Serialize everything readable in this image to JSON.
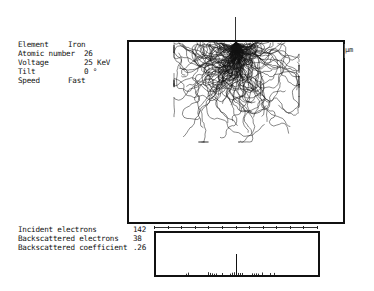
{
  "parameters": [
    {
      "label": "Element",
      "value": "Iron"
    },
    {
      "label": "Atomic number",
      "value": "26"
    },
    {
      "label": "Voltage",
      "value": "25 KeV"
    },
    {
      "label": "Tilt",
      "value": "0 °"
    },
    {
      "label": "Speed",
      "value": "Fast"
    }
  ],
  "results": [
    {
      "label": "Incident electrons",
      "value": "142"
    },
    {
      "label": "Backscattered electrons",
      "value": "38"
    },
    {
      "label": "Backscattered coefficient",
      "value": ".26"
    }
  ],
  "plot": {
    "unit_label": "µm",
    "ruler_ticks": 13
  },
  "colors": {
    "ink": "#111111",
    "background": "#ffffff"
  }
}
